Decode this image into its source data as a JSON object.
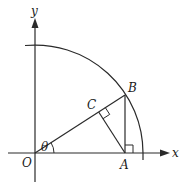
{
  "diagram": {
    "type": "geometry",
    "axes": {
      "x_label": "x",
      "y_label": "y"
    },
    "points": {
      "O": {
        "label": "O"
      },
      "A": {
        "label": "A"
      },
      "B": {
        "label": "B"
      },
      "C": {
        "label": "C"
      }
    },
    "angle_label": "θ",
    "right_angles": [
      "at A (OA ⟂ AB)",
      "at C (AC ⟂ OB)"
    ],
    "colors": {
      "stroke": "#2a2a2a",
      "background": "#ffffff"
    }
  }
}
